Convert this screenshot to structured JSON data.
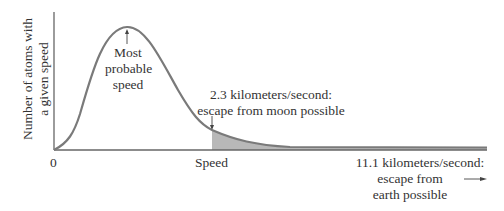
{
  "diagram": {
    "y_axis_label_line1": "Number of atoms with",
    "y_axis_label_line2": "a given speed",
    "x_axis_label": "Speed",
    "origin_label": "0",
    "peak_annotation": {
      "line1": "Most",
      "line2": "probable",
      "line3": "speed"
    },
    "moon_annotation": {
      "line1": "2.3 kilometers/second:",
      "line2": "escape from moon possible"
    },
    "earth_annotation": {
      "line1": "11.1 kilometers/second:",
      "line2": "escape from",
      "line3": "earth possible",
      "arrow": "→"
    },
    "colors": {
      "curve": "#7a7a7a",
      "axis": "#666666",
      "shade": "#b8b8b8",
      "text": "#333333"
    }
  }
}
